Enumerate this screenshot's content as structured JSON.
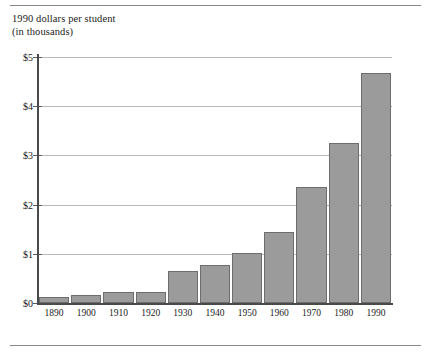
{
  "figure": {
    "axis_title_line1": "1990 dollars per student",
    "axis_title_line2": "(in thousands)",
    "bar_fill_color": "#9b9b9b",
    "bar_stroke_color": "#6e6e6e",
    "gridline_color": "#b9b9b9",
    "axis_color": "#4a4a4a",
    "background_color": "#ffffff",
    "rule_color": "#888888"
  },
  "chart_data": {
    "type": "bar",
    "title": "1990 dollars per student (in thousands)",
    "xlabel": "",
    "ylabel": "1990 dollars per student (in thousands)",
    "categories": [
      "1890",
      "1900",
      "1910",
      "1920",
      "1930",
      "1940",
      "1950",
      "1960",
      "1970",
      "1980",
      "1990"
    ],
    "values": [
      0.13,
      0.17,
      0.23,
      0.23,
      0.65,
      0.77,
      1.02,
      1.45,
      2.36,
      3.25,
      4.68
    ],
    "ylim": [
      0,
      5
    ],
    "ytick_values": [
      0,
      1,
      2,
      3,
      4,
      5
    ],
    "ytick_labels": [
      "$0",
      "$1",
      "$2",
      "$3",
      "$4",
      "$5"
    ],
    "xtick_labels": [
      "1890",
      "1900",
      "1910",
      "1920",
      "1930",
      "1940",
      "1950",
      "1960",
      "1970",
      "1980",
      "1990"
    ],
    "grid": true,
    "grid_axis": "y",
    "legend": false,
    "legend_position": "none",
    "series": [
      {
        "name": "1990 dollars per student (in thousands)",
        "values": [
          0.13,
          0.17,
          0.23,
          0.23,
          0.65,
          0.77,
          1.02,
          1.45,
          2.36,
          3.25,
          4.68
        ]
      }
    ]
  }
}
